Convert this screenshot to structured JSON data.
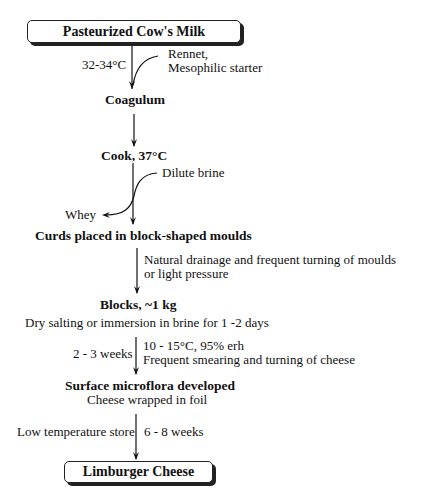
{
  "flowchart": {
    "title_box": "Pasteurized Cow's Milk",
    "end_box": "Limburger Cheese",
    "steps": [
      {
        "label": "Coagulum"
      },
      {
        "label": "Cook,  37°C"
      },
      {
        "label": "Curds placed in block-shaped moulds"
      },
      {
        "label": "Blocks,  ~1 kg",
        "note": "Dry salting or immersion in brine for 1 -2 days"
      },
      {
        "label": "Surface microflora developed",
        "note": "Cheese wrapped in foil"
      }
    ],
    "annotations": {
      "temp_coag": "32-34°C",
      "additions_1": "Rennet,",
      "additions_2": "Mesophilic starter",
      "dilute_brine": "Dilute brine",
      "whey": "Whey",
      "drainage_1": "Natural drainage and frequent turning of moulds",
      "drainage_2": "or light pressure",
      "ripen_time": "2 - 3 weeks",
      "ripen_cond_1": "10 - 15°C,  95% erh",
      "ripen_cond_2": "Frequent smearing and turning of cheese",
      "store": "Low temperature store",
      "store_time": "6 - 8 weeks"
    }
  }
}
